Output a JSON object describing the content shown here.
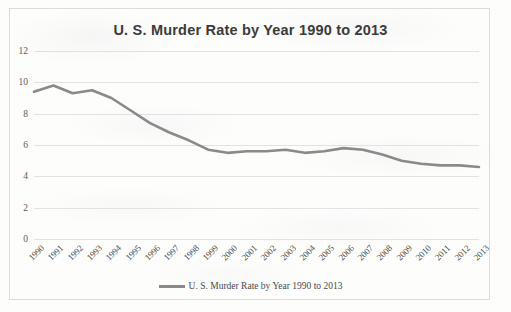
{
  "chart_data": {
    "type": "line",
    "title": "U. S. Murder Rate by Year 1990 to 2013",
    "xlabel": "",
    "ylabel": "",
    "ylim": [
      0,
      12
    ],
    "y_ticks": [
      0,
      2,
      4,
      6,
      8,
      10,
      12
    ],
    "grid": "horizontal",
    "legend_position": "bottom",
    "legend": [
      "U. S. Murder Rate by Year 1990 to 2013"
    ],
    "line_color": "#8a8a8a",
    "categories": [
      "1990",
      "1991",
      "1992",
      "1993",
      "1994",
      "1995",
      "1996",
      "1997",
      "1998",
      "1999",
      "2000",
      "2001",
      "2002",
      "2003",
      "2004",
      "2005",
      "2006",
      "2007",
      "2008",
      "2009",
      "2010",
      "2011",
      "2012",
      "2013"
    ],
    "series": [
      {
        "name": "U. S. Murder Rate by Year 1990 to 2013",
        "values": [
          9.4,
          9.8,
          9.3,
          9.5,
          9.0,
          8.2,
          7.4,
          6.8,
          6.3,
          5.7,
          5.5,
          5.6,
          5.6,
          5.7,
          5.5,
          5.6,
          5.8,
          5.7,
          5.4,
          5.0,
          4.8,
          4.7,
          4.7,
          4.6
        ]
      }
    ]
  }
}
